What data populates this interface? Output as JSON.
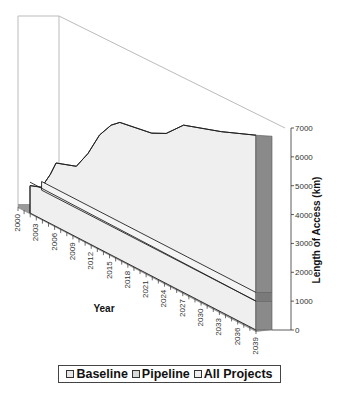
{
  "chart_data": {
    "type": "area",
    "style": "3d-stacked-area",
    "title": "",
    "xlabel": "Year",
    "ylabel": "Length of Access (km)",
    "ylim": [
      0,
      7000
    ],
    "y_ticks": [
      0,
      1000,
      2000,
      3000,
      4000,
      5000,
      6000,
      7000
    ],
    "x_ticks": [
      "2000",
      "2003",
      "2006",
      "2009",
      "2012",
      "2015",
      "2018",
      "2021",
      "2024",
      "2027",
      "2030",
      "2033",
      "2036",
      "2039"
    ],
    "x_range": [
      2000,
      2039
    ],
    "grid": false,
    "legend_position": "bottom",
    "series": [
      {
        "name": "Baseline",
        "color": "#e6e6e6",
        "points": [
          [
            2000,
            1000
          ],
          [
            2039,
            1000
          ]
        ]
      },
      {
        "name": "Pipeline",
        "color": "#d9d9d9",
        "points": [
          [
            2000,
            1300
          ],
          [
            2039,
            1300
          ]
        ]
      },
      {
        "name": "All Projects",
        "color": "#efefef",
        "points": [
          [
            2000,
            950
          ],
          [
            2002,
            1100
          ],
          [
            2003.5,
            1700
          ],
          [
            2004.5,
            2200
          ],
          [
            2008,
            2450
          ],
          [
            2010,
            3100
          ],
          [
            2012,
            3950
          ],
          [
            2014,
            4500
          ],
          [
            2015.5,
            4750
          ],
          [
            2021,
            4950
          ],
          [
            2023.5,
            5200
          ],
          [
            2026.5,
            5800
          ],
          [
            2033,
            6250
          ],
          [
            2039,
            6750
          ]
        ]
      }
    ]
  },
  "legend": {
    "items": [
      {
        "label": "Baseline"
      },
      {
        "label": "Pipeline"
      },
      {
        "label": "All Projects"
      }
    ]
  },
  "colors": {
    "side_face": "#8a8a8a",
    "floor_band": "#9a9a9a",
    "front_fill": "#efefef",
    "outline": "#222222",
    "wall_line": "#bbbbbb"
  }
}
